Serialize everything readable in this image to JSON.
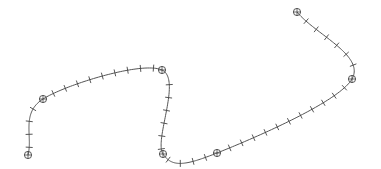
{
  "diagram": {
    "type": "spline-curve",
    "background": "#ffffff",
    "stroke_color": "#555555",
    "knot_marker": "circle-with-cross",
    "tick_marker": "perpendicular-tick",
    "knots": [
      {
        "x": 28,
        "y": 155
      },
      {
        "x": 43,
        "y": 99
      },
      {
        "x": 162,
        "y": 70
      },
      {
        "x": 163,
        "y": 154
      },
      {
        "x": 217,
        "y": 153
      },
      {
        "x": 352,
        "y": 79
      },
      {
        "x": 297,
        "y": 12
      }
    ],
    "tick_spacing_px": 13,
    "tick_length_px": 7
  }
}
